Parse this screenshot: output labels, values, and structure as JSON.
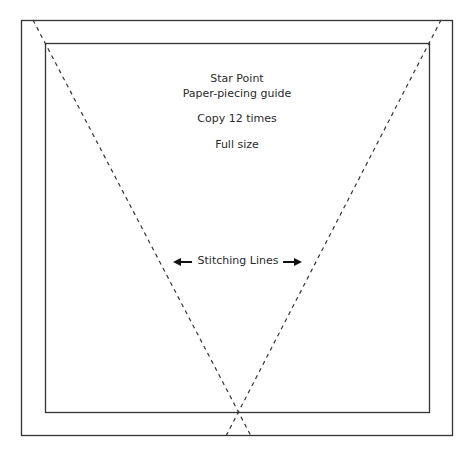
{
  "title": {
    "line1": "Star Point",
    "line2": "Paper-piecing guide"
  },
  "instructions": {
    "copies": "Copy 12 times",
    "scale": "Full size"
  },
  "annotation": {
    "label": "Stitching Lines",
    "left_arrow": "left-arrow",
    "right_arrow": "right-arrow"
  },
  "colors": {
    "line": "#2a2a2a",
    "background": "#ffffff"
  }
}
